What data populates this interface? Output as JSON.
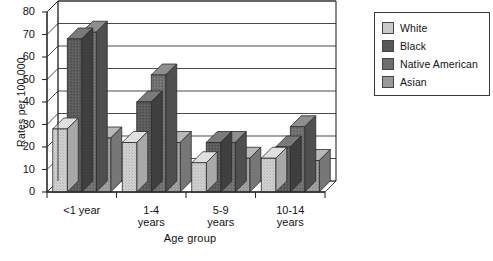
{
  "chart_data": {
    "type": "bar",
    "title": "",
    "subtitle": "",
    "xlabel": "Age group",
    "ylabel": "Rates per 100,000",
    "categories": [
      "<1 year",
      "1-4 years",
      "5-9 years",
      "10-14 years"
    ],
    "category_lines": [
      [
        "<1 year"
      ],
      [
        "1-4",
        "years"
      ],
      [
        "5-9",
        "years"
      ],
      [
        "10-14",
        "years"
      ]
    ],
    "series": [
      {
        "name": "White",
        "color": "#c9c9c9",
        "values": [
          28,
          22,
          13,
          15
        ]
      },
      {
        "name": "Black",
        "color": "#585858",
        "values": [
          68,
          40,
          22,
          20
        ]
      },
      {
        "name": "Native American",
        "color": "#6e6e6e",
        "values": [
          71,
          52,
          22,
          29
        ]
      },
      {
        "name": "Asian",
        "color": "#9a9a9a",
        "values": [
          24,
          22,
          15,
          14
        ]
      }
    ],
    "ylim": [
      0,
      80
    ],
    "yticks": [
      0,
      10,
      20,
      30,
      40,
      50,
      60,
      70,
      80
    ],
    "ytick_labels": [
      "0",
      "10",
      "20",
      "30",
      "40",
      "50",
      "60",
      "70",
      "80"
    ],
    "grid": true,
    "grid_axis": "y",
    "legend_position": "right",
    "style": "3d-bar",
    "background_color": "#ffffff",
    "axis_color": "#2b2b2b"
  },
  "legend": {
    "entries": [
      {
        "label": "White"
      },
      {
        "label": "Black"
      },
      {
        "label": "Native American"
      },
      {
        "label": "Asian"
      }
    ]
  }
}
